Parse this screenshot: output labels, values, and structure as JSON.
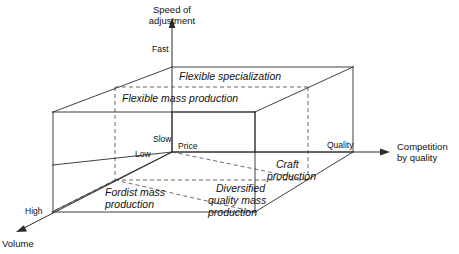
{
  "figure": {
    "type": "diagram"
  },
  "axes": {
    "vertical": {
      "title_line1": "Speed of",
      "title_line2": "adjustment",
      "tick_high": "Fast",
      "tick_low": "Slow"
    },
    "horizontal": {
      "title_line1": "Competition",
      "title_line2": "by quality",
      "tick_far": "Quality",
      "tick_near": "Price"
    },
    "depth": {
      "title": "Volume",
      "tick_far": "High",
      "tick_near": "Low"
    }
  },
  "regions": {
    "flexible_specialization": {
      "line1": "Flexible specialization"
    },
    "flexible_mass_production": {
      "line1": "Flexible mass production"
    },
    "craft_production": {
      "line1": "Craft",
      "line2": "production"
    },
    "fordist_mass_production": {
      "line1": "Fordist mass",
      "line2": "production"
    },
    "diversified_quality_mass_production": {
      "line1": "Diversified",
      "line2": "quality mass",
      "line3": "production"
    }
  },
  "colors": {
    "stroke": "#2b2b2b",
    "hidden_stroke": "#5a5a5a",
    "text": "#111111",
    "background": "#ffffff"
  }
}
